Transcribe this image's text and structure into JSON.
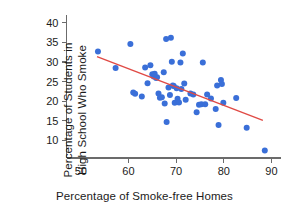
{
  "chart_data": {
    "type": "scatter",
    "title": "",
    "xlabel": "Percentage of Smoke-free Homes",
    "ylabel_line1": "Percentage of Students in",
    "ylabel_line2": "High School Who Smoke",
    "xlim": [
      47,
      92
    ],
    "ylim": [
      5.5,
      41.5
    ],
    "xticks": [
      50,
      60,
      70,
      80,
      90
    ],
    "yticks": [
      10,
      15,
      20,
      25,
      30,
      35,
      40
    ],
    "grid": false,
    "legend": false,
    "point_color": "#3a6fd8",
    "point_radius_px": 3.0,
    "trendline": {
      "name": "least-squares regression line",
      "color": "#e04a45",
      "x": [
        53.4,
        88.2
      ],
      "y": [
        31.4,
        15.1
      ]
    },
    "points": [
      {
        "x": 53.6,
        "y": 32.7
      },
      {
        "x": 57.3,
        "y": 28.5
      },
      {
        "x": 60.4,
        "y": 34.6
      },
      {
        "x": 61.0,
        "y": 22.2
      },
      {
        "x": 61.4,
        "y": 21.9
      },
      {
        "x": 62.8,
        "y": 21.2
      },
      {
        "x": 63.5,
        "y": 28.6
      },
      {
        "x": 64.0,
        "y": 24.6
      },
      {
        "x": 64.6,
        "y": 29.2
      },
      {
        "x": 65.0,
        "y": 26.9
      },
      {
        "x": 65.3,
        "y": 26.3
      },
      {
        "x": 65.5,
        "y": 27.0
      },
      {
        "x": 65.8,
        "y": 25.9
      },
      {
        "x": 66.0,
        "y": 26.1
      },
      {
        "x": 66.3,
        "y": 22.0
      },
      {
        "x": 66.6,
        "y": 20.9
      },
      {
        "x": 67.0,
        "y": 21.0
      },
      {
        "x": 67.4,
        "y": 27.4
      },
      {
        "x": 67.6,
        "y": 19.4
      },
      {
        "x": 67.9,
        "y": 35.9
      },
      {
        "x": 68.0,
        "y": 14.7
      },
      {
        "x": 68.4,
        "y": 23.5
      },
      {
        "x": 68.7,
        "y": 21.6
      },
      {
        "x": 68.9,
        "y": 36.2
      },
      {
        "x": 69.1,
        "y": 30.1
      },
      {
        "x": 69.3,
        "y": 24.0
      },
      {
        "x": 69.5,
        "y": 23.9
      },
      {
        "x": 69.7,
        "y": 19.6
      },
      {
        "x": 70.1,
        "y": 23.3
      },
      {
        "x": 70.3,
        "y": 20.6
      },
      {
        "x": 70.6,
        "y": 19.7
      },
      {
        "x": 70.9,
        "y": 29.9
      },
      {
        "x": 71.1,
        "y": 23.1
      },
      {
        "x": 71.4,
        "y": 32.2
      },
      {
        "x": 71.7,
        "y": 24.5
      },
      {
        "x": 72.0,
        "y": 20.4
      },
      {
        "x": 73.0,
        "y": 22.0
      },
      {
        "x": 73.6,
        "y": 21.7
      },
      {
        "x": 74.3,
        "y": 17.2
      },
      {
        "x": 74.8,
        "y": 19.1
      },
      {
        "x": 75.3,
        "y": 19.2
      },
      {
        "x": 75.6,
        "y": 29.9
      },
      {
        "x": 76.1,
        "y": 19.2
      },
      {
        "x": 76.5,
        "y": 21.7
      },
      {
        "x": 77.3,
        "y": 20.7
      },
      {
        "x": 78.3,
        "y": 18.0
      },
      {
        "x": 78.6,
        "y": 24.0
      },
      {
        "x": 78.9,
        "y": 13.9
      },
      {
        "x": 79.4,
        "y": 25.4
      },
      {
        "x": 79.6,
        "y": 24.4
      },
      {
        "x": 79.9,
        "y": 19.6
      },
      {
        "x": 82.6,
        "y": 20.8
      },
      {
        "x": 84.8,
        "y": 13.2
      },
      {
        "x": 88.6,
        "y": 7.4
      }
    ]
  }
}
